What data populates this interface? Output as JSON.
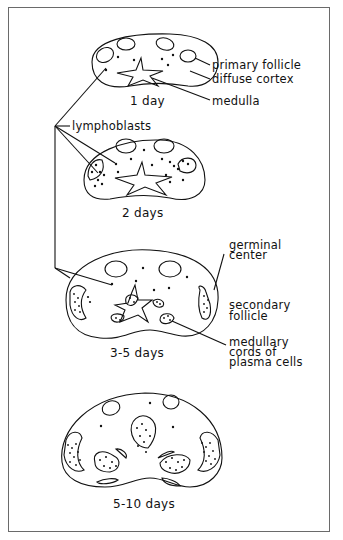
{
  "figure": {
    "stages": [
      {
        "id": "stage1",
        "caption": "1 day"
      },
      {
        "id": "stage2",
        "caption": "2 days"
      },
      {
        "id": "stage3",
        "caption": "3-5 days"
      },
      {
        "id": "stage4",
        "caption": "5-10 days"
      }
    ],
    "labels": {
      "primary_follicle": "primary follicle",
      "diffuse_cortex": "diffuse cortex",
      "medulla": "medulla",
      "lymphoblasts": "lymphoblasts",
      "germinal_center_1": "germinal",
      "germinal_center_2": "center",
      "secondary_follicle_1": "secondary",
      "secondary_follicle_2": "follicle",
      "medullary_cords_1": "medullary",
      "medullary_cords_2": "cords of",
      "medullary_cords_3": "plasma cells"
    },
    "colors": {
      "ink": "#111111",
      "frame": "#6a6a6a",
      "background": "#ffffff"
    }
  }
}
